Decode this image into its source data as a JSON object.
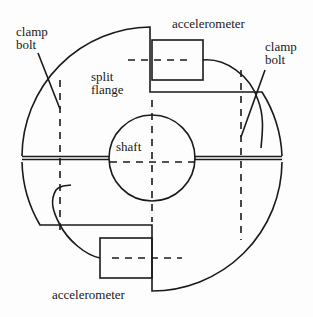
{
  "diagram": {
    "labels": {
      "clamp_bolt_left": [
        "clamp",
        "bolt"
      ],
      "clamp_bolt_right": [
        "clamp",
        "bolt"
      ],
      "split_flange": [
        "split",
        "flange"
      ],
      "shaft": "shaft",
      "accelerometer_top": "accelerometer",
      "accelerometer_bottom": "accelerometer"
    },
    "colors": {
      "stroke": "#1a1a1a",
      "background": "#fdfdfd"
    }
  }
}
